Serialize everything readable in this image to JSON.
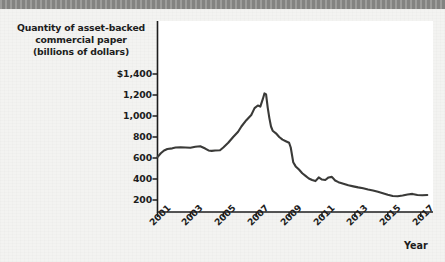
{
  "figure": {
    "background_color": "#f3f3f1",
    "plot_background_color": "#ffffff",
    "top_band_color": "#8a8a88",
    "axis_color": "#1d1d1d",
    "line_color": "#3a3a38"
  },
  "chart_data": {
    "type": "line",
    "title": "",
    "ylabel": "Quantity of asset-backed commercial paper (billions of dollars)",
    "ylabel_lines": [
      "Quantity of asset-backed",
      "commercial paper",
      "(billions of dollars)"
    ],
    "xlabel": "Year",
    "ytick_labels": [
      "$1,400",
      "1,200",
      "1,000",
      "800",
      "600",
      "400",
      "200"
    ],
    "ytick_values": [
      1400,
      1200,
      1000,
      800,
      600,
      400,
      200
    ],
    "xtick_labels": [
      "2001",
      "2003",
      "2005",
      "2007",
      "2009",
      "2011",
      "2013",
      "2015",
      "2017"
    ],
    "xtick_values": [
      2001,
      2003,
      2005,
      2007,
      2009,
      2011,
      2013,
      2015,
      2017
    ],
    "xlim": [
      2001,
      2017.6
    ],
    "ylim": [
      0,
      1500
    ],
    "grid": false,
    "legend": null,
    "series": [
      {
        "name": "Asset-backed commercial paper outstanding",
        "x": [
          2001.0,
          2001.2,
          2001.4,
          2001.6,
          2001.9,
          2002.1,
          2002.4,
          2002.7,
          2003.0,
          2003.3,
          2003.6,
          2003.9,
          2004.1,
          2004.3,
          2004.5,
          2004.8,
          2005.0,
          2005.3,
          2005.6,
          2005.9,
          2006.1,
          2006.4,
          2006.7,
          2006.9,
          2007.1,
          2007.25,
          2007.4,
          2007.5,
          2007.6,
          2007.7,
          2007.8,
          2007.9,
          2008.0,
          2008.2,
          2008.4,
          2008.6,
          2008.8,
          2009.0,
          2009.1,
          2009.25,
          2009.4,
          2009.6,
          2009.8,
          2010.0,
          2010.2,
          2010.4,
          2010.6,
          2010.8,
          2011.0,
          2011.2,
          2011.4,
          2011.6,
          2011.8,
          2012.0,
          2012.3,
          2012.6,
          2012.9,
          2013.2,
          2013.5,
          2013.8,
          2014.1,
          2014.4,
          2014.7,
          2015.0,
          2015.3,
          2015.6,
          2015.9,
          2016.2,
          2016.5,
          2016.8,
          2017.1,
          2017.4
        ],
        "y": [
          608,
          645,
          672,
          686,
          692,
          700,
          703,
          700,
          698,
          707,
          712,
          690,
          672,
          668,
          672,
          674,
          700,
          745,
          800,
          850,
          900,
          960,
          1010,
          1075,
          1100,
          1090,
          1160,
          1215,
          1205,
          1080,
          980,
          900,
          860,
          835,
          800,
          775,
          760,
          745,
          700,
          560,
          520,
          490,
          455,
          430,
          405,
          390,
          380,
          415,
          395,
          390,
          415,
          420,
          385,
          370,
          355,
          340,
          330,
          320,
          312,
          300,
          290,
          278,
          265,
          250,
          238,
          235,
          243,
          252,
          258,
          248,
          245,
          248
        ]
      }
    ]
  },
  "annotations": {
    "peak_value": 1215,
    "peak_year": 2007.5,
    "start_value": 608,
    "end_value": 248
  }
}
